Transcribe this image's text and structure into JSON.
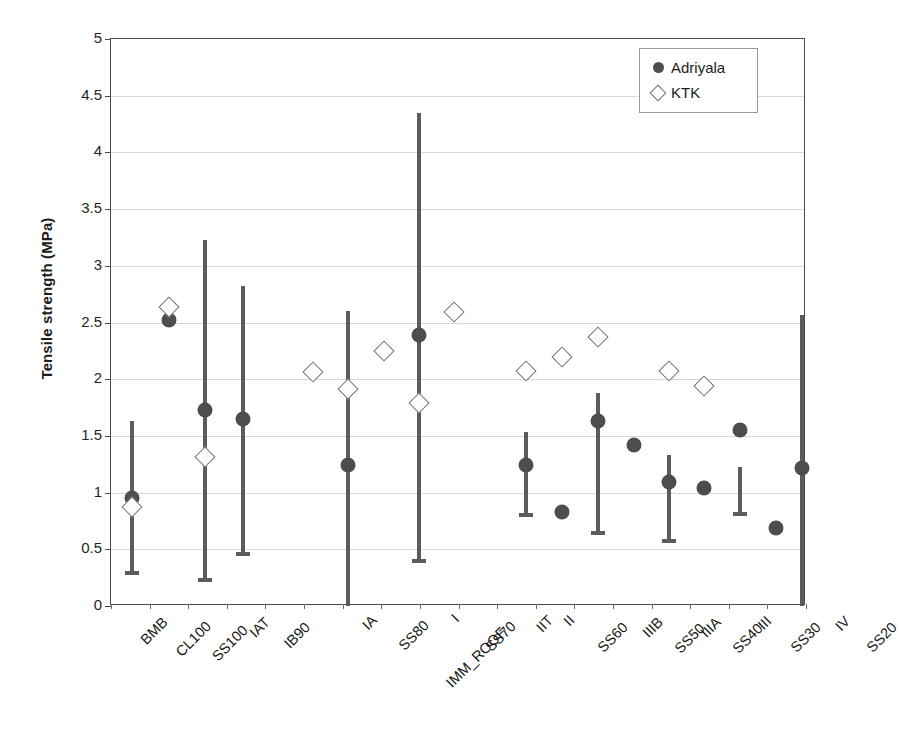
{
  "chart_data": {
    "type": "scatter",
    "title": "",
    "xlabel": "",
    "ylabel": "Tensile strength (MPa)",
    "ylim": [
      0,
      5
    ],
    "ytick_step": 0.5,
    "ytick_labels": [
      "5",
      "4.5",
      "4",
      "3.5",
      "3",
      "2.5",
      "2",
      "1.5",
      "1",
      "0.5",
      "0"
    ],
    "ytick_values": [
      5,
      4.5,
      4,
      3.5,
      3,
      2.5,
      2,
      1.5,
      1,
      0.5,
      0
    ],
    "grid": true,
    "legend_position": "top-right",
    "legend": [
      {
        "name": "Adriyala",
        "marker": "filled-circle",
        "color": "#4d4d4d"
      },
      {
        "name": "KTK",
        "marker": "open-diamond",
        "color": "#6d6d6d"
      }
    ],
    "categories": [
      {
        "index": 0,
        "top": "BMB",
        "mid": "",
        "bot": ""
      },
      {
        "index": 1,
        "top": "CL100",
        "mid": "",
        "bot": ""
      },
      {
        "index": 2,
        "top": "SS100",
        "mid": "",
        "bot": ""
      },
      {
        "index": 3,
        "top": "IAT",
        "mid": "",
        "bot": ""
      },
      {
        "index": 4,
        "top": "IB90",
        "mid": "",
        "bot": ""
      },
      {
        "index": 5,
        "top": "",
        "mid": "",
        "bot": ""
      },
      {
        "index": 6,
        "top": "",
        "mid": "",
        "bot": ""
      },
      {
        "index": 7,
        "top": "IA",
        "mid": "",
        "bot": ""
      },
      {
        "index": 8,
        "top": "SS80",
        "mid": "",
        "bot": ""
      },
      {
        "index": 9,
        "top": "",
        "mid": "IMM_ROOF",
        "bot": ""
      },
      {
        "index": 10,
        "top": "I",
        "mid": "",
        "bot": ""
      },
      {
        "index": 11,
        "top": "SS70",
        "mid": "",
        "bot": ""
      },
      {
        "index": 12,
        "top": "IIT",
        "mid": "",
        "bot": ""
      },
      {
        "index": 13,
        "top": "II",
        "mid": "",
        "bot": ""
      },
      {
        "index": 14,
        "top": "SS60",
        "mid": "",
        "bot": ""
      },
      {
        "index": 15,
        "top": "IIIB",
        "mid": "",
        "bot": ""
      },
      {
        "index": 16,
        "top": "SS50",
        "mid": "",
        "bot": ""
      },
      {
        "index": 17,
        "top": "IIIA",
        "mid": "",
        "bot": ""
      },
      {
        "index": 18,
        "top": "SS40",
        "mid": "",
        "bot": ""
      },
      {
        "index": 19,
        "top": "III",
        "mid": "",
        "bot": ""
      },
      {
        "index": 20,
        "top": "SS30",
        "mid": "",
        "bot": ""
      },
      {
        "index": 21,
        "top": "IV",
        "mid": "",
        "bot": ""
      },
      {
        "index": 22,
        "top": "SS20",
        "mid": "",
        "bot": ""
      }
    ],
    "xlabels_ordered": [
      "BMB",
      "CL100",
      "SS100",
      "IAT",
      "IB90",
      "IA",
      "SS80",
      "IMM_ROOF",
      "I",
      "SS70",
      "IIT",
      "II",
      "SS60",
      "IIIB",
      "SS50",
      "IIIA",
      "SS40",
      "III",
      "SS30",
      "IV",
      "SS20"
    ],
    "series": [
      {
        "name": "Adriyala",
        "marker": "filled-circle",
        "points": [
          {
            "x_px": 131,
            "value": 0.95,
            "low": 0.29,
            "high": 1.63
          },
          {
            "x_px": 168,
            "value": 2.52,
            "low": null,
            "high": null
          },
          {
            "x_px": 204,
            "value": 1.73,
            "low": 0.23,
            "high": 3.23
          },
          {
            "x_px": 242,
            "value": 1.65,
            "low": 0.46,
            "high": 2.82
          },
          {
            "x_px": 347,
            "value": 1.24,
            "low": 0.0,
            "high": 2.6
          },
          {
            "x_px": 418,
            "value": 2.39,
            "low": 0.4,
            "high": 4.35
          },
          {
            "x_px": 525,
            "value": 1.24,
            "low": 0.8,
            "high": 1.53
          },
          {
            "x_px": 561,
            "value": 0.83,
            "low": null,
            "high": null
          },
          {
            "x_px": 597,
            "value": 1.63,
            "low": 0.64,
            "high": 1.88
          },
          {
            "x_px": 633,
            "value": 1.42,
            "low": null,
            "high": null
          },
          {
            "x_px": 668,
            "value": 1.09,
            "low": 0.57,
            "high": 1.33
          },
          {
            "x_px": 703,
            "value": 1.04,
            "low": null,
            "high": null
          },
          {
            "x_px": 739,
            "value": 1.55,
            "low": 0.81,
            "high": 1.23
          },
          {
            "x_px": 775,
            "value": 0.69,
            "low": null,
            "high": null
          },
          {
            "x_px": 801,
            "value": 1.22,
            "low": 0.0,
            "high": 2.57
          }
        ]
      },
      {
        "name": "KTK",
        "marker": "open-diamond",
        "points": [
          {
            "x_px": 131,
            "value": 0.87
          },
          {
            "x_px": 168,
            "value": 2.64
          },
          {
            "x_px": 204,
            "value": 1.31
          },
          {
            "x_px": 312,
            "value": 2.06
          },
          {
            "x_px": 347,
            "value": 1.91
          },
          {
            "x_px": 383,
            "value": 2.25
          },
          {
            "x_px": 453,
            "value": 2.59
          },
          {
            "x_px": 418,
            "value": 1.79
          },
          {
            "x_px": 525,
            "value": 2.07
          },
          {
            "x_px": 561,
            "value": 2.2
          },
          {
            "x_px": 597,
            "value": 2.37
          },
          {
            "x_px": 668,
            "value": 2.07
          },
          {
            "x_px": 703,
            "value": 1.94
          }
        ]
      }
    ]
  },
  "legend": {
    "adriyala_label": "Adriyala",
    "ktk_label": "KTK"
  },
  "axes": {
    "y_title": "Tensile strength (MPa)"
  }
}
